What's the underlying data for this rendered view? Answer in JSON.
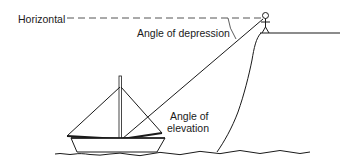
{
  "diagram": {
    "type": "trigonometry-illustration",
    "labels": {
      "horizontal": "Horizontal",
      "angle_of_depression": "Angle of depression",
      "angle_of_elevation_line1": "Angle of",
      "angle_of_elevation_line2": "elevation"
    },
    "elements": [
      {
        "name": "horizontal-reference-line",
        "style": "dashed"
      },
      {
        "name": "observer",
        "kind": "stick-figure",
        "location": "cliff-top"
      },
      {
        "name": "cliff",
        "kind": "outline"
      },
      {
        "name": "line-of-sight",
        "from": "observer",
        "to": "sailboat"
      },
      {
        "name": "sailboat",
        "parts": [
          "mast",
          "left-sail",
          "right-sail",
          "hull"
        ]
      },
      {
        "name": "waterline"
      }
    ],
    "colors": {
      "ink": "#1a1a1a",
      "background": "#ffffff",
      "dashed_line": "#555555"
    }
  }
}
